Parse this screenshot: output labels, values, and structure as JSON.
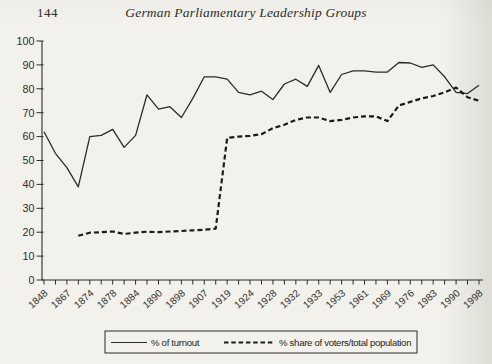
{
  "header": {
    "page_number": "144",
    "title": "German Parliamentary Leadership Groups"
  },
  "legend": {
    "turnout_label": "% of turnout",
    "share_label": "% share of voters/total population"
  },
  "colors": {
    "paper": "#f2f1ec",
    "ink": "#2b2b2b",
    "turnout_line": "#2b2b2b",
    "share_line": "#1a1a1a"
  },
  "chart_data": {
    "type": "line",
    "title": "",
    "xlabel": "",
    "ylabel": "",
    "ylim": [
      0,
      100
    ],
    "y_tick_step": 10,
    "grid": false,
    "legend_position": "bottom-center",
    "x_tick_label_rotation_deg": -42,
    "x_years": [
      "1848",
      "1867",
      "1867",
      "1871",
      "1874",
      "1877",
      "1878",
      "1881",
      "1884",
      "1887",
      "1890",
      "1893",
      "1898",
      "1903",
      "1907",
      "1912",
      "1919",
      "1920",
      "1924",
      "1924",
      "1928",
      "1930",
      "1932",
      "1932",
      "1933",
      "1949",
      "1953",
      "1957",
      "1961",
      "1965",
      "1969",
      "1972",
      "1976",
      "1980",
      "1983",
      "1987",
      "1990",
      "1994",
      "1998"
    ],
    "x_labels_shown": [
      "1848",
      "1867",
      "1874",
      "1878",
      "1884",
      "1890",
      "1898",
      "1907",
      "1919",
      "1924",
      "1928",
      "1932",
      "1933",
      "1953",
      "1961",
      "1969",
      "1976",
      "1983",
      "1990",
      "1998"
    ],
    "series": [
      {
        "name": "% of turnout",
        "style": "solid",
        "values": [
          62,
          53,
          47,
          39,
          60,
          60.5,
          63,
          55.5,
          60.5,
          77.5,
          71.5,
          72.5,
          68,
          76,
          85,
          85,
          84,
          78.5,
          77.5,
          79,
          75.5,
          82,
          84,
          81,
          89.8,
          78.5,
          86,
          87.5,
          87.5,
          87,
          87,
          91,
          90.8,
          89,
          90,
          85,
          78.5,
          78,
          81.5
        ]
      },
      {
        "name": "% share of voters/total population",
        "style": "dashed",
        "values": [
          null,
          null,
          null,
          18.5,
          19.8,
          20,
          20.3,
          19.3,
          19.8,
          20.2,
          20,
          20.3,
          20.5,
          20.8,
          21,
          21.5,
          59.5,
          60,
          60.3,
          61,
          63.5,
          65,
          67,
          68,
          68,
          66.5,
          67,
          68,
          68.5,
          68.5,
          66.5,
          73,
          74.5,
          76,
          77,
          78.5,
          80.5,
          76.5,
          75
        ]
      }
    ]
  }
}
